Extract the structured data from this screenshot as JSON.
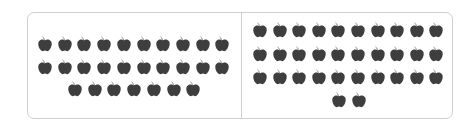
{
  "colors": {
    "apple": "#3e3e3e",
    "stem": "#8a8a8a",
    "border": "#cfcfcf"
  },
  "panels": [
    {
      "name": "left-group",
      "count": 27,
      "rows": [
        {
          "count": 10,
          "y": 36,
          "x0": 37
        },
        {
          "count": 10,
          "y": 59,
          "x0": 37
        },
        {
          "count": 7,
          "y": 81,
          "x0": 67
        }
      ],
      "spacing": 19.7
    },
    {
      "name": "right-group",
      "count": 32,
      "rows": [
        {
          "count": 10,
          "y": 22,
          "x0": 252
        },
        {
          "count": 10,
          "y": 46,
          "x0": 252
        },
        {
          "count": 10,
          "y": 69,
          "x0": 252
        },
        {
          "count": 2,
          "y": 92,
          "x0": 331
        }
      ],
      "spacing": 19.6
    }
  ]
}
